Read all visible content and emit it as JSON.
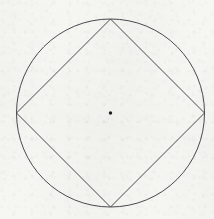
{
  "figure": {
    "background_color": "#f6f6f3",
    "stroke_color": "#4a4a50",
    "stroke_width": 1,
    "canvas": {
      "width": 214,
      "height": 219
    },
    "center_point": {
      "label": "center",
      "x": 110.5,
      "y": 113.0,
      "radius": 1.7,
      "fill_color": "#1e1e20"
    },
    "circle": {
      "label": "circumscribed circle",
      "cx": 110.5,
      "cy": 113.0,
      "r": 94.0,
      "fill": "none"
    },
    "square": {
      "label": "inscribed square",
      "orientation": "rotated 45 degrees (diamond)",
      "fill": "none",
      "vertices": [
        {
          "name": "top",
          "x": 110.5,
          "y": 19.0
        },
        {
          "name": "right",
          "x": 204.5,
          "y": 113.0
        },
        {
          "name": "bottom",
          "x": 110.5,
          "y": 207.0
        },
        {
          "name": "left",
          "x": 16.5,
          "y": 113.0
        }
      ],
      "points_attr": "110.5,19.0 204.5,113.0 110.5,207.0 16.5,113.0"
    }
  }
}
